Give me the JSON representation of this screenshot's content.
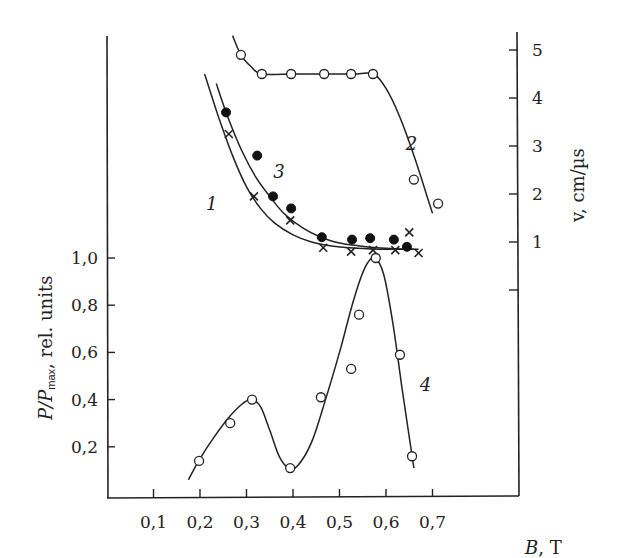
{
  "chart_data": {
    "type": "scatter",
    "title": "",
    "xlabel": "B, T",
    "xlabel_var": "B",
    "xlabel_unit": ", T",
    "ylabel_left": "P/Pmax, rel. units",
    "ylabel_left_parts": {
      "p": "P/P",
      "sub": "max",
      "rest": ", rel. units"
    },
    "ylabel_right": "v, cm/µs",
    "xlim": [
      0,
      0.8
    ],
    "ylim_left": [
      0,
      1.0
    ],
    "ylim_right": [
      0,
      5
    ],
    "x_ticks": [
      0.1,
      0.2,
      0.3,
      0.4,
      0.5,
      0.6,
      0.7
    ],
    "x_tick_labels": [
      "0,1",
      "0,2",
      "0,3",
      "0,4",
      "0,5",
      "0,6",
      "0,7"
    ],
    "y_left_ticks": [
      0.2,
      0.4,
      0.6,
      0.8,
      1.0
    ],
    "y_left_tick_labels": [
      "0,2",
      "0,4",
      "0,6",
      "0,8",
      "1,0"
    ],
    "y_right_ticks": [
      0,
      1,
      2,
      3,
      4,
      5
    ],
    "y_right_tick_labels": [
      "",
      "1",
      "2",
      "3",
      "4",
      "5"
    ],
    "grid": false,
    "legend": "none (curves numbered inline)",
    "series": [
      {
        "name": "1",
        "axis": "right",
        "marker": "cross",
        "x": [
          0.262,
          0.316,
          0.394,
          0.465,
          0.525,
          0.572,
          0.62,
          0.65,
          0.67
        ],
        "y": [
          3.25,
          1.95,
          1.45,
          0.88,
          0.8,
          0.83,
          0.83,
          1.2,
          0.77
        ],
        "fit_x": [
          0.21,
          0.24,
          0.27,
          0.3,
          0.33,
          0.36,
          0.4,
          0.44,
          0.48,
          0.52,
          0.56,
          0.6,
          0.64,
          0.67
        ],
        "fit_y": [
          4.5,
          3.6,
          2.8,
          2.15,
          1.7,
          1.4,
          1.15,
          1.0,
          0.92,
          0.88,
          0.86,
          0.85,
          0.85,
          0.85
        ],
        "label_pos": [
          0.225,
          1.8
        ]
      },
      {
        "name": "2",
        "axis": "right",
        "marker": "open-circle",
        "x": [
          0.288,
          0.333,
          0.396,
          0.467,
          0.525,
          0.572,
          0.66,
          0.712
        ],
        "y": [
          4.9,
          4.5,
          4.5,
          4.5,
          4.5,
          4.5,
          2.3,
          1.8
        ],
        "fit_x": [
          0.27,
          0.288,
          0.31,
          0.333,
          0.4,
          0.47,
          0.53,
          0.572,
          0.6,
          0.63,
          0.66,
          0.69,
          0.7
        ],
        "fit_y": [
          5.3,
          4.9,
          4.65,
          4.5,
          4.5,
          4.5,
          4.5,
          4.5,
          4.2,
          3.6,
          2.8,
          1.9,
          1.6
        ],
        "label_pos": [
          0.655,
          3.05
        ]
      },
      {
        "name": "3",
        "axis": "right",
        "marker": "filled-circle",
        "x": [
          0.256,
          0.323,
          0.357,
          0.396,
          0.462,
          0.527,
          0.566,
          0.617,
          0.645
        ],
        "y": [
          3.7,
          2.8,
          1.95,
          1.7,
          1.1,
          1.05,
          1.08,
          1.05,
          0.9
        ],
        "fit_x": [
          0.235,
          0.26,
          0.29,
          0.32,
          0.35,
          0.38,
          0.42,
          0.46,
          0.5,
          0.54,
          0.58,
          0.62,
          0.66
        ],
        "fit_y": [
          4.3,
          3.6,
          2.9,
          2.35,
          1.95,
          1.6,
          1.3,
          1.1,
          0.98,
          0.92,
          0.88,
          0.86,
          0.85
        ],
        "label_pos": [
          0.37,
          2.45
        ]
      },
      {
        "name": "4",
        "axis": "left",
        "marker": "open-circle",
        "x": [
          0.198,
          0.265,
          0.312,
          0.394,
          0.46,
          0.525,
          0.542,
          0.578,
          0.63,
          0.656
        ],
        "y": [
          0.14,
          0.3,
          0.4,
          0.11,
          0.41,
          0.53,
          0.76,
          1.0,
          0.59,
          0.16
        ],
        "fit_x": [
          0.175,
          0.2,
          0.23,
          0.26,
          0.29,
          0.31,
          0.33,
          0.35,
          0.37,
          0.39,
          0.41,
          0.44,
          0.47,
          0.5,
          0.53,
          0.555,
          0.575,
          0.595,
          0.615,
          0.635,
          0.65,
          0.66
        ],
        "fit_y": [
          0.06,
          0.15,
          0.24,
          0.32,
          0.38,
          0.4,
          0.37,
          0.27,
          0.16,
          0.11,
          0.12,
          0.22,
          0.4,
          0.6,
          0.82,
          0.96,
          1.0,
          0.93,
          0.72,
          0.44,
          0.24,
          0.11
        ],
        "label_pos": [
          0.685,
          0.46
        ]
      }
    ]
  }
}
